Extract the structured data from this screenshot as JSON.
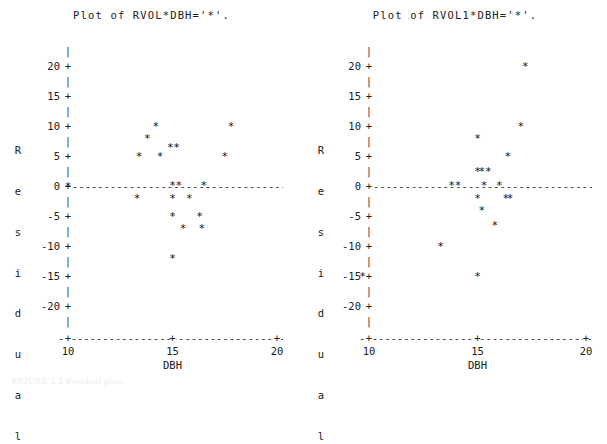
{
  "page": {
    "footnote": "FIGURE 3.3 Residual plots"
  },
  "plots": [
    {
      "id": "left",
      "title": "Plot of RVOL*DBH='*'.",
      "ylabel_chars": [
        "R",
        "e",
        "s",
        "i",
        "d",
        "u",
        "a",
        "l"
      ],
      "ylabel_text": "Residual",
      "xlabel": "DBH",
      "y_ticks": [
        "20",
        "15",
        "10",
        "5",
        "0",
        "-5",
        "-10",
        "-15",
        "-20"
      ],
      "y_tick_values": [
        20,
        15,
        10,
        5,
        0,
        -5,
        -10,
        -15,
        -20
      ],
      "x_ticks": [
        "10",
        "15",
        "20"
      ],
      "x_tick_values": [
        10,
        15,
        20
      ],
      "tick_marker": "+",
      "minor_marker": "|",
      "point_marker": "*",
      "zero_line_marker": "-"
    },
    {
      "id": "right",
      "title": "Plot of RVOL1*DBH='*'.",
      "ylabel_chars": [
        "R",
        "e",
        "s",
        "i",
        "d",
        "u",
        "a",
        "l"
      ],
      "ylabel_text": "Residual",
      "xlabel": "DBH",
      "y_ticks": [
        "20",
        "15",
        "10",
        "5",
        "0",
        "-5",
        "-10",
        "-15",
        "-20"
      ],
      "y_tick_values": [
        20,
        15,
        10,
        5,
        0,
        -5,
        -10,
        -15,
        -20
      ],
      "x_ticks": [
        "10",
        "15",
        "20"
      ],
      "x_tick_values": [
        10,
        15,
        20
      ],
      "tick_marker": "+",
      "minor_marker": "|",
      "point_marker": "*",
      "zero_line_marker": "-"
    }
  ],
  "chart_data": [
    {
      "type": "scatter",
      "title": "Plot of RVOL*DBH='*'.",
      "xlabel": "DBH",
      "ylabel": "Residual",
      "xlim": [
        9.0,
        20.6
      ],
      "ylim": [
        -22.5,
        22.5
      ],
      "grid": false,
      "legend": "none",
      "marker": "*",
      "series": [
        {
          "name": "RVOL",
          "points": [
            [
              10.0,
              0.0
            ],
            [
              13.3,
              -2.0
            ],
            [
              13.4,
              5.0
            ],
            [
              13.8,
              8.0
            ],
            [
              14.2,
              10.0
            ],
            [
              14.4,
              5.0
            ],
            [
              14.9,
              6.5
            ],
            [
              15.0,
              -12.0
            ],
            [
              15.0,
              -5.0
            ],
            [
              15.0,
              -2.0
            ],
            [
              15.0,
              0.2
            ],
            [
              15.2,
              6.5
            ],
            [
              15.3,
              0.2
            ],
            [
              15.5,
              -7.0
            ],
            [
              15.8,
              -2.0
            ],
            [
              16.3,
              -5.0
            ],
            [
              16.4,
              -7.0
            ],
            [
              16.5,
              0.2
            ],
            [
              17.5,
              5.0
            ],
            [
              17.8,
              10.0
            ]
          ]
        }
      ]
    },
    {
      "type": "scatter",
      "title": "Plot of RVOL1*DBH='*'.",
      "xlabel": "DBH",
      "ylabel": "Residual",
      "xlim": [
        9.0,
        20.6
      ],
      "ylim": [
        -22.5,
        22.5
      ],
      "grid": false,
      "legend": "none",
      "marker": "*",
      "series": [
        {
          "name": "RVOL1",
          "points": [
            [
              9.7,
              -15.0
            ],
            [
              13.3,
              -10.0
            ],
            [
              13.8,
              0.2
            ],
            [
              14.1,
              0.2
            ],
            [
              15.0,
              -15.0
            ],
            [
              15.0,
              -2.0
            ],
            [
              15.0,
              2.5
            ],
            [
              15.0,
              8.0
            ],
            [
              15.2,
              2.5
            ],
            [
              15.2,
              -4.0
            ],
            [
              15.3,
              0.2
            ],
            [
              15.5,
              2.5
            ],
            [
              15.8,
              -6.5
            ],
            [
              16.0,
              0.2
            ],
            [
              16.3,
              -2.0
            ],
            [
              16.4,
              5.0
            ],
            [
              16.5,
              -2.0
            ],
            [
              17.0,
              10.0
            ],
            [
              17.2,
              20.0
            ]
          ]
        }
      ]
    }
  ]
}
